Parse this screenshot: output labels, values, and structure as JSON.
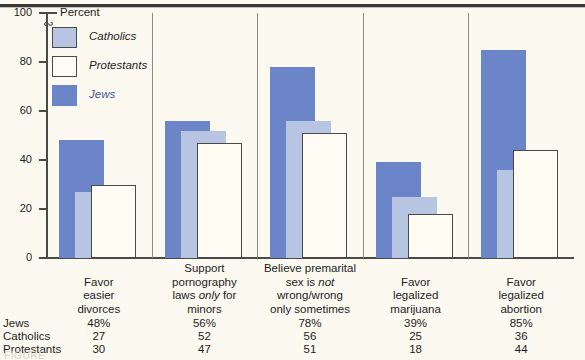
{
  "figure": {
    "top_rule": true,
    "caption_partial": "FIGURE"
  },
  "axis": {
    "unit_label": "Percent",
    "ticks": [
      "100",
      "80",
      "60",
      "40",
      "20",
      "0"
    ],
    "tick_values": [
      100,
      80,
      60,
      40,
      20,
      0
    ],
    "has_break_mark": true
  },
  "legend": {
    "items": [
      {
        "label": "Catholics",
        "key": "catholics",
        "color": "#B7C5E3",
        "style": "filled-light"
      },
      {
        "label": "Protestants",
        "key": "protestants",
        "color": "#FDFBF2",
        "style": "outline"
      },
      {
        "label": "Jews",
        "key": "jews",
        "color": "#6B85C8",
        "style": "filled-dark"
      }
    ]
  },
  "table": {
    "row_labels": [
      "Jews",
      "Catholics",
      "Protestants"
    ],
    "rows": [
      {
        "name": "Jews",
        "values": [
          "48%",
          "56%",
          "78%",
          "39%",
          "85%"
        ]
      },
      {
        "name": "Catholics",
        "values": [
          "27",
          "52",
          "56",
          "25",
          "36"
        ]
      },
      {
        "name": "Protestants",
        "values": [
          "30",
          "47",
          "51",
          "18",
          "44"
        ]
      }
    ]
  },
  "chart_data": {
    "type": "bar",
    "title": "",
    "subtitle": "",
    "xlabel": "",
    "ylabel": "Percent",
    "ylim": [
      0,
      100
    ],
    "yticks": [
      0,
      20,
      40,
      60,
      80,
      100
    ],
    "grid": false,
    "legend_position": "top-left inside plot",
    "overlap_style": "overlapping offset bars, Jews back-left, Catholics middle, Protestants front-right",
    "categories": [
      "Favor easier divorces",
      "Support pornography laws only for minors",
      "Believe premarital sex is not wrong/wrong only sometimes",
      "Favor legalized marijuana",
      "Favor legalized abortion"
    ],
    "category_lines": [
      [
        "Favor",
        "easier",
        "divorces"
      ],
      [
        "Support",
        "pornography",
        "laws |only| for",
        "minors"
      ],
      [
        "Believe premarital",
        "sex is |not|",
        "wrong/wrong",
        "only sometimes"
      ],
      [
        "Favor",
        "legalized",
        "marijuana"
      ],
      [
        "Favor",
        "legalized",
        "abortion"
      ]
    ],
    "series": [
      {
        "name": "Jews",
        "color": "#6B85C8",
        "values": [
          48,
          56,
          78,
          39,
          85
        ]
      },
      {
        "name": "Catholics",
        "color": "#B7C5E3",
        "values": [
          27,
          52,
          56,
          25,
          36
        ]
      },
      {
        "name": "Protestants",
        "color": "#FDFBF2",
        "values": [
          30,
          47,
          51,
          18,
          44
        ]
      }
    ]
  }
}
